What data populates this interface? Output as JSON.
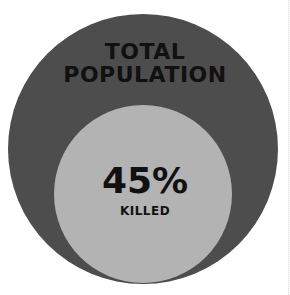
{
  "chart_data": {
    "type": "nested-circle (proportional area)",
    "title": "",
    "outer": {
      "label": "TOTAL POPULATION",
      "value": 100,
      "color": "#4d4d4d"
    },
    "inner": {
      "label": "KILLED",
      "value": 45,
      "display": "45%",
      "color": "#b3b3b3"
    },
    "text_color": "#111111"
  },
  "labels": {
    "outer_line1": "TOTAL",
    "outer_line2": "POPULATION",
    "inner_value": "45%",
    "inner_label": "KILLED"
  }
}
